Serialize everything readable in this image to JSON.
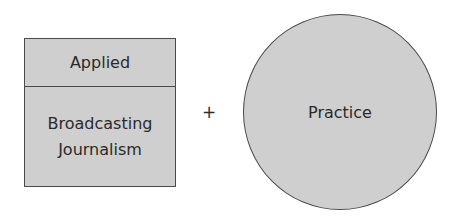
{
  "diagram": {
    "box": {
      "top_label": "Applied",
      "bottom_lines": [
        "Broadcasting",
        "Journalism"
      ]
    },
    "operator": "+",
    "circle": {
      "label": "Practice"
    },
    "colors": {
      "fill": "#cfcfcf",
      "stroke": "#4a4a4a",
      "text": "#2a2a2a"
    }
  }
}
